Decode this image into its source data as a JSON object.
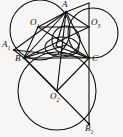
{
  "figure": {
    "kind": "geometry-diagram",
    "width": 123,
    "height": 137,
    "background_color": "#f7f6f4",
    "stroke_color": "#111111",
    "label_color": "#111111"
  },
  "labels": {
    "A": "A",
    "B": "B",
    "C": "C",
    "A1_main": "A",
    "A1_sub": "1",
    "B1_main": "B",
    "B1_sub": "1",
    "O1_main": "O",
    "O1_sub": "1",
    "O2_main": "O",
    "O2_sub": "2",
    "O3_main": "O",
    "O3_sub": "3"
  },
  "points": {
    "A": {
      "x": 66,
      "y": 12
    },
    "B": {
      "x": 24,
      "y": 58
    },
    "C": {
      "x": 89,
      "y": 58
    },
    "A1": {
      "x": 14,
      "y": 50
    },
    "B1": {
      "x": 89,
      "y": 124
    },
    "O1": {
      "x": 38,
      "y": 27
    },
    "O2": {
      "x": 57,
      "y": 91
    },
    "O3": {
      "x": 89,
      "y": 27
    },
    "T": {
      "x": 89,
      "y": 3
    },
    "M": {
      "x": 66,
      "y": 45
    },
    "N": {
      "x": 56,
      "y": 46
    }
  },
  "circles": [
    {
      "name": "circle-O1",
      "cx": 40,
      "cy": 30,
      "r": 30
    },
    {
      "name": "circle-O3",
      "cx": 93,
      "cy": 33,
      "r": 25
    },
    {
      "name": "circle-O2",
      "cx": 57,
      "cy": 91,
      "r": 39
    },
    {
      "name": "circle-inner-small",
      "cx": 66,
      "cy": 40,
      "r": 14
    },
    {
      "name": "circle-inner-flat",
      "cx": 62,
      "cy": 47,
      "r": 11
    }
  ],
  "segments": [
    {
      "name": "segment-A-B",
      "from": "A",
      "to": "B"
    },
    {
      "name": "segment-A-C",
      "from": "A",
      "to": "C"
    },
    {
      "name": "segment-B-C",
      "from": "B",
      "to": "C"
    },
    {
      "name": "segment-A1-B",
      "from": "A1",
      "to": "B"
    },
    {
      "name": "segment-A1-A",
      "from": "A1",
      "to": "A"
    },
    {
      "name": "segment-A1-C",
      "from": "A1",
      "to": "C"
    },
    {
      "name": "segment-B-B1",
      "from": "B",
      "to": "B1"
    },
    {
      "name": "segment-B-O2",
      "from": "B",
      "to": "O2"
    },
    {
      "name": "segment-C-O2",
      "from": "C",
      "to": "O2"
    },
    {
      "name": "segment-A-O2",
      "from": "A",
      "to": "O2"
    },
    {
      "name": "segment-C-B1",
      "from": "C",
      "to": "B1"
    },
    {
      "name": "segment-O1-O3",
      "from": "O1",
      "to": "O3"
    },
    {
      "name": "segment-O1-A",
      "from": "O1",
      "to": "A"
    },
    {
      "name": "segment-O1-C",
      "from": "O1",
      "to": "C"
    },
    {
      "name": "segment-O1-B",
      "from": "O1",
      "to": "B"
    },
    {
      "name": "segment-O3-A",
      "from": "O3",
      "to": "A"
    },
    {
      "name": "segment-O3-B",
      "from": "O3",
      "to": "B"
    },
    {
      "name": "segment-A-T",
      "from": "A",
      "to": "T"
    },
    {
      "name": "segment-T-C",
      "from": "T",
      "to": "C"
    },
    {
      "name": "segment-B-M",
      "from": "B",
      "to": "M"
    },
    {
      "name": "segment-A-N",
      "from": "A",
      "to": "N"
    },
    {
      "name": "segment-N-C",
      "from": "N",
      "to": "C"
    }
  ]
}
